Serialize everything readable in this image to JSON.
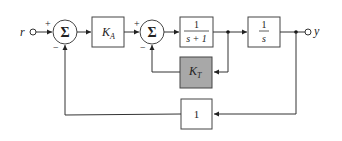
{
  "diagram": {
    "type": "block-diagram",
    "input": {
      "label": "r"
    },
    "output": {
      "label": "y"
    },
    "summing_junctions": [
      {
        "id": "sum1",
        "symbol": "Σ",
        "signs": {
          "left": "+",
          "bottom": "−"
        }
      },
      {
        "id": "sum2",
        "symbol": "Σ",
        "signs": {
          "left": "+",
          "bottom": "−"
        }
      }
    ],
    "blocks": {
      "ka": {
        "label_main": "K",
        "label_sub": "A"
      },
      "plant1": {
        "numerator": "1",
        "denominator": "s + 1"
      },
      "integrator": {
        "numerator": "1",
        "denominator": "s"
      },
      "kt": {
        "label_main": "K",
        "label_sub": "T",
        "fill": "#a8a8a8"
      },
      "unity": {
        "label": "1"
      }
    },
    "colors": {
      "line": "#333333",
      "shaded_block": "#a8a8a8",
      "background": "#ffffff"
    }
  }
}
